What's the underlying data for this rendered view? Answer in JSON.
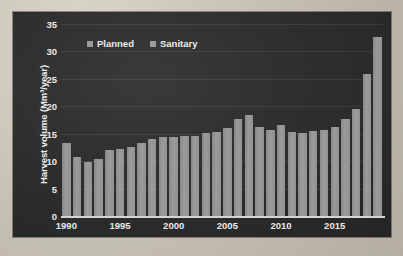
{
  "chart_data": {
    "type": "bar",
    "title": "",
    "xlabel": "",
    "ylabel": "Harvest volume  (Mm³/year)",
    "ylim": [
      0,
      35
    ],
    "yticks": [
      0,
      5,
      10,
      15,
      20,
      25,
      30,
      35
    ],
    "xticks": [
      1990,
      1995,
      2000,
      2005,
      2010,
      2015
    ],
    "grid": true,
    "legend_position": "top-left",
    "legend": [
      "Planned",
      "Sanitary"
    ],
    "series": [
      {
        "name": "Planned",
        "color": "#9d9d9d",
        "values": [
          13.4,
          10.8,
          9.9,
          10.4,
          12.0,
          12.2,
          12.6,
          13.4,
          14.1,
          14.4,
          14.4,
          14.6,
          14.6,
          15.1,
          15.4,
          16.0,
          17.6,
          18.4,
          16.3,
          15.7,
          16.6,
          15.4,
          15.1,
          15.5,
          15.7,
          16.2,
          17.6,
          19.5,
          25.8,
          32.7
        ]
      }
    ],
    "categories": [
      1990,
      1991,
      1992,
      1993,
      1994,
      1995,
      1996,
      1997,
      1998,
      1999,
      2000,
      2001,
      2002,
      2003,
      2004,
      2005,
      2006,
      2007,
      2008,
      2009,
      2010,
      2011,
      2012,
      2013,
      2014,
      2015,
      2016,
      2017,
      2018,
      2019
    ],
    "colors": {
      "background": "#2e2e2e",
      "bar": "#9d9d9d",
      "text": "#f0f0f0",
      "gridline": "#4a4a4a",
      "axis": "#d8d8d8"
    }
  }
}
